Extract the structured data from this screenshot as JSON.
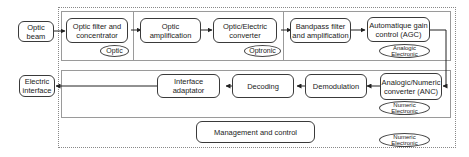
{
  "diagram": {
    "inputs": {
      "optic_beam": "Optic beam",
      "electric_interface": "Electric interface"
    },
    "top_chain": [
      {
        "label": "Optic filter and concentrator"
      },
      {
        "label": "Optic amplification"
      },
      {
        "label": "Optic/Electric converter"
      },
      {
        "label": "Bandpass filter and amplification"
      },
      {
        "label": "Automatique gain control (AGC)"
      }
    ],
    "bottom_chain": [
      {
        "label": "Analogic/Numeric converter (ANC)"
      },
      {
        "label": "Demodulation"
      },
      {
        "label": "Decoding"
      },
      {
        "label": "Interface adaptator"
      }
    ],
    "management": "Management and control",
    "domain_tags": {
      "optic": "Optic",
      "optronic": "Optronic",
      "analogic": "Analogic Electronic",
      "numeric_mid": "Numeric Electronic",
      "numeric_outer": "Numeric Electronic"
    }
  }
}
